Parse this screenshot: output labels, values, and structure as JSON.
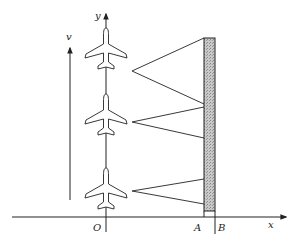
{
  "diagram": {
    "axes": {
      "x_label": "x",
      "y_label": "y",
      "origin_label": "O"
    },
    "velocity_label": "v",
    "points": [
      {
        "label": "A"
      },
      {
        "label": "B"
      }
    ],
    "aircraft_count": 3,
    "colors": {
      "line": "#222222",
      "wall_fill": "#bdbdbd",
      "aircraft_fill": "#ffffff"
    }
  }
}
